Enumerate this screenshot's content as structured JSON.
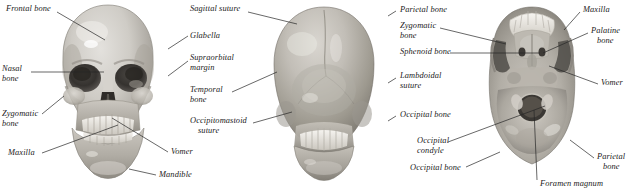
{
  "figure": {
    "background_color": "#ffffff",
    "label_color": "#1a1a1a",
    "leader_color": "#262626",
    "width": 636,
    "height": 194
  },
  "panels": [
    {
      "id": "anterior",
      "view_name": "anterior-skull-view",
      "labels": [
        {
          "id": "frontal-bone",
          "text": "Frontal bone",
          "x": 6,
          "y": 8,
          "align": "left",
          "lines": [
            "Frontal bone"
          ]
        },
        {
          "id": "nasal-bone",
          "text": "Nasal bone",
          "x": 2,
          "y": 68,
          "align": "left",
          "lines": [
            "Nasal",
            "bone"
          ]
        },
        {
          "id": "zygomatic-bone",
          "text": "Zygomatic bone",
          "x": 2,
          "y": 113,
          "align": "left",
          "lines": [
            "Zygomatic",
            "bone"
          ]
        },
        {
          "id": "maxilla",
          "text": "Maxilla",
          "x": 8,
          "y": 151,
          "align": "left",
          "lines": [
            "Maxilla"
          ]
        },
        {
          "id": "mandible",
          "text": "Mandible",
          "x": 158,
          "y": 172,
          "align": "left",
          "lines": [
            "Mandible"
          ]
        },
        {
          "id": "vomer",
          "text": "Vomer",
          "x": 170,
          "y": 151,
          "align": "left",
          "lines": [
            "Vomer"
          ]
        }
      ]
    },
    {
      "id": "posterior",
      "view_name": "posterior-skull-view",
      "labels": [
        {
          "id": "sagittal-suture",
          "text": "Sagittal suture",
          "x": 190,
          "y": 8,
          "align": "left",
          "lines": [
            "Sagittal suture"
          ]
        },
        {
          "id": "glabella",
          "text": "Glabella",
          "x": 190,
          "y": 33,
          "align": "left",
          "lines": [
            "Glabella"
          ]
        },
        {
          "id": "supraorbital-margin",
          "text": "Supraorbital margin",
          "x": 190,
          "y": 55,
          "align": "left",
          "lines": [
            "Supraorbital",
            "margin"
          ]
        },
        {
          "id": "temporal-bone",
          "text": "Temporal bone",
          "x": 190,
          "y": 88,
          "align": "left",
          "lines": [
            "Temporal",
            "bone"
          ]
        },
        {
          "id": "occipitomastoid-suture",
          "text": "Occipitomastoid suture",
          "x": 190,
          "y": 119,
          "align": "left",
          "lines": [
            "Occipitomastoid",
            "suture"
          ]
        }
      ]
    },
    {
      "id": "inferior",
      "view_name": "inferior-skull-base-view",
      "labels": [
        {
          "id": "parietal-bone-left",
          "text": "Parietal bone",
          "x": 398,
          "y": 8,
          "align": "left",
          "lines": [
            "Parietal bone"
          ]
        },
        {
          "id": "zygomatic-bone-base",
          "text": "Zygomatic bone",
          "x": 398,
          "y": 24,
          "align": "left",
          "lines": [
            "Zygomatic",
            "bone"
          ]
        },
        {
          "id": "sphenoid-bone",
          "text": "Sphenoid bone",
          "x": 398,
          "y": 50,
          "align": "left",
          "lines": [
            "Sphenoid bone"
          ]
        },
        {
          "id": "lambdoidal-suture",
          "text": "Lambdoidal suture",
          "x": 398,
          "y": 74,
          "align": "left",
          "lines": [
            "Lambdoidal",
            "suture"
          ]
        },
        {
          "id": "occipital-bone-upper",
          "text": "Occipital bone",
          "x": 398,
          "y": 113,
          "align": "left",
          "lines": [
            "Occipital bone"
          ]
        },
        {
          "id": "occipital-condyle",
          "text": "Occipital condyle",
          "x": 415,
          "y": 139,
          "align": "left",
          "lines": [
            "Occipital",
            "condyle"
          ]
        },
        {
          "id": "occipital-bone-lower",
          "text": "Occipital bone",
          "x": 409,
          "y": 166,
          "align": "left",
          "lines": [
            "Occipital bone"
          ]
        },
        {
          "id": "maxilla-base",
          "text": "Maxilla",
          "x": 582,
          "y": 8,
          "align": "left",
          "lines": [
            "Maxilla"
          ]
        },
        {
          "id": "palatine-bone",
          "text": "Palatine bone",
          "x": 590,
          "y": 29,
          "align": "left",
          "lines": [
            "Palatine",
            "bone"
          ]
        },
        {
          "id": "vomer-base",
          "text": "Vomer",
          "x": 600,
          "y": 81,
          "align": "left",
          "lines": [
            "Vomer"
          ]
        },
        {
          "id": "parietal-bone-right",
          "text": "Parietal bone",
          "x": 596,
          "y": 155,
          "align": "left",
          "lines": [
            "Parietal",
            "bone"
          ]
        },
        {
          "id": "foramen-magnum",
          "text": "Foramen magnum",
          "x": 539,
          "y": 182,
          "align": "left",
          "lines": [
            "Foramen magnum"
          ]
        }
      ]
    }
  ]
}
